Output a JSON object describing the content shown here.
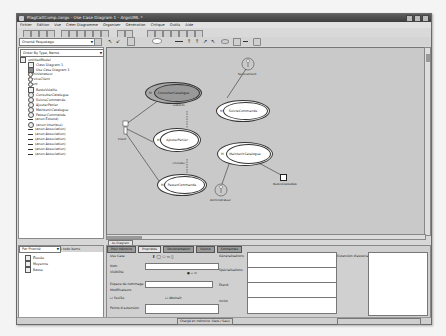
{
  "window": {
    "title": "PlagCaltComp.zargo - Use Case Diagram 1 - ArgoUML *"
  },
  "menu": [
    "Fichier",
    "Édition",
    "Vue",
    "Créer Diagramme",
    "Organiser",
    "Génération",
    "Critique",
    "Outils",
    "Aide"
  ],
  "navigator": {
    "perspective": "Orienté Paquetage",
    "order": "Order By Type, Name",
    "tree": [
      {
        "label": "untitledModel",
        "icon": "package-icon",
        "indent": 0
      },
      {
        "label": "Class Diagram 1",
        "icon": "diagram-icon",
        "indent": 1
      },
      {
        "label": "Use Case Diagram 1",
        "icon": "diagram-icon",
        "indent": 1
      },
      {
        "label": "Administrateur",
        "icon": "actor-icon",
        "indent": 1
      },
      {
        "label": "ServiceClient",
        "icon": "actor-icon",
        "indent": 1
      },
      {
        "label": "Client",
        "icon": "actor-icon",
        "indent": 1
      },
      {
        "label": "RestoVolaille",
        "icon": "component-icon",
        "indent": 1
      },
      {
        "label": "ConsulterCatalogue",
        "icon": "usecase-icon",
        "indent": 1
      },
      {
        "label": "SuivreCommande",
        "icon": "usecase-icon",
        "indent": 1
      },
      {
        "label": "AjouterPanier",
        "icon": "usecase-icon",
        "indent": 1
      },
      {
        "label": "MaintenirCatalogue",
        "icon": "usecase-icon",
        "indent": 1
      },
      {
        "label": "PasserCommande",
        "icon": "usecase-icon",
        "indent": 1
      },
      {
        "label": "(anon Extend)",
        "icon": "extend-icon",
        "indent": 1
      },
      {
        "label": "(anon Interface)",
        "icon": "interface-icon",
        "indent": 1
      },
      {
        "label": "(anon Association)",
        "icon": "association-icon",
        "indent": 1
      },
      {
        "label": "(anon Association)",
        "icon": "association-icon",
        "indent": 1
      },
      {
        "label": "(anon Association)",
        "icon": "association-icon",
        "indent": 1
      },
      {
        "label": "(anon Association)",
        "icon": "association-icon",
        "indent": 1
      },
      {
        "label": "(anon Association)",
        "icon": "association-icon",
        "indent": 1
      },
      {
        "label": "(anon Association)",
        "icon": "association-icon",
        "indent": 1
      }
    ]
  },
  "diagram": {
    "usecases": [
      {
        "label": "ConsulterCatalogue",
        "selected": true
      },
      {
        "label": "AjouterPanier",
        "selected": false
      },
      {
        "label": "PasserCommande",
        "selected": false
      },
      {
        "label": "SuivreCommande",
        "selected": false
      },
      {
        "label": "MaintenirCatalogue",
        "selected": false
      }
    ],
    "actors": [
      {
        "label": "Client"
      },
      {
        "label": "ServiceClient"
      },
      {
        "label": "Administrateur"
      }
    ],
    "component": {
      "label": "RestoVolailleWeb"
    },
    "stereotypes": {
      "extend1": "«extend»",
      "extend2": "«include»"
    },
    "tab_label": "As Diagram"
  },
  "todo": {
    "by": "Par Priorité",
    "count_label": "1 todo items",
    "items": [
      "Élevée",
      "Moyenne",
      "Basse"
    ]
  },
  "properties": {
    "tabs": [
      "Pour mémoire",
      "Propriétés",
      "Documentation",
      "Source",
      "Contraintes"
    ],
    "active_tab": 1,
    "type_label": "Use Case",
    "labels": {
      "name": "Nom",
      "namespace": "Généralisations",
      "visibility": "Visibilité",
      "specializations": "Spécialisations",
      "stereotype": "Espace de nommage",
      "extends": "Étend",
      "modifiers": "Modificateurs",
      "leaf": "Feuille",
      "abstract": "Abstrait",
      "includes": "Inclut",
      "extension_points": "Points d'extension",
      "ext_point_label": "Extension d'association"
    }
  },
  "status": {
    "message": "Chargé en mémoire: Stats / Sauv.",
    "right": ""
  }
}
